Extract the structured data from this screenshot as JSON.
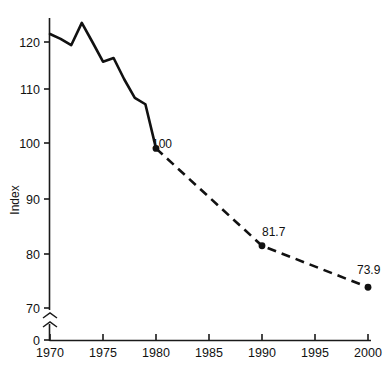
{
  "chart_data": {
    "type": "line",
    "title": "",
    "xlabel": "",
    "ylabel": "Index",
    "xlim": [
      1970,
      2000
    ],
    "ylim": [
      66,
      126
    ],
    "grid": false,
    "legend": "none",
    "y_axis_break": true,
    "y_break_label": "0",
    "xticks": [
      "1970",
      "1975",
      "1980",
      "1985",
      "1990",
      "1995",
      "2000"
    ],
    "yticks": [
      "70",
      "80",
      "90",
      "100",
      "110",
      "120"
    ],
    "series": [
      {
        "name": "historical",
        "style": "solid",
        "x": [
          1970,
          1971,
          1972,
          1973,
          1974,
          1975,
          1976,
          1977,
          1978,
          1979,
          1980
        ],
        "values": [
          121.5,
          120.6,
          119.4,
          123.6,
          120.0,
          116.3,
          117.0,
          113.0,
          109.5,
          108.3,
          100.0
        ]
      },
      {
        "name": "projected",
        "style": "dashed",
        "x": [
          1980,
          1990,
          2000
        ],
        "values": [
          100.0,
          81.7,
          73.9
        ]
      }
    ],
    "annotations": [
      {
        "label": "100",
        "x": 1980,
        "y": 100.0
      },
      {
        "label": "81.7",
        "x": 1990,
        "y": 81.7
      },
      {
        "label": "73.9",
        "x": 2000,
        "y": 73.9
      }
    ]
  },
  "colors": {
    "line": "#111111",
    "axis": "#1a1a1a",
    "background": "#ffffff"
  }
}
